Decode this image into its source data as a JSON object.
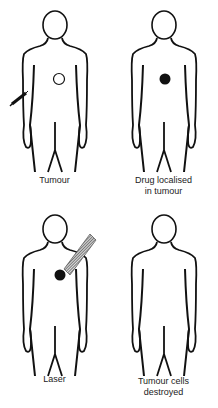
{
  "panels": [
    {
      "id": "tumour",
      "caption_line1": "Tumour",
      "caption_line2": "",
      "marker": "open-circle",
      "extra": "syringe-injection"
    },
    {
      "id": "drug",
      "caption_line1": "Drug localised",
      "caption_line2": "in tumour",
      "marker": "filled-circle",
      "extra": ""
    },
    {
      "id": "laser",
      "caption_line1": "Laser",
      "caption_line2": "",
      "marker": "filled-circle",
      "extra": "laser-beam"
    },
    {
      "id": "destroyed",
      "caption_line1": "Tumour cells",
      "caption_line2": "destroyed",
      "marker": "none",
      "extra": ""
    }
  ],
  "colors": {
    "outline": "#111111",
    "beam": "#666666",
    "background": "#ffffff"
  }
}
